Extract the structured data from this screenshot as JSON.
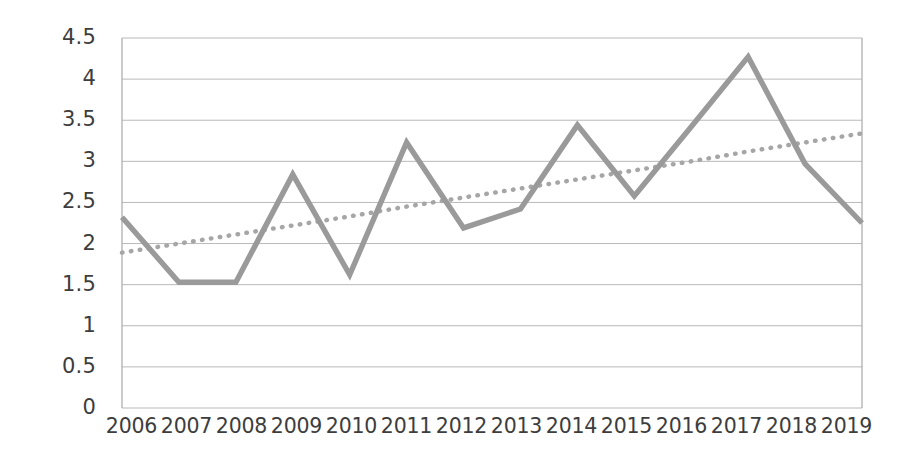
{
  "chart_data": {
    "type": "line",
    "title": "",
    "xlabel": "",
    "ylabel": "",
    "categories": [
      "2006",
      "2007",
      "2008",
      "2009",
      "2010",
      "2011",
      "2012",
      "2013",
      "2014",
      "2015",
      "2016",
      "2017",
      "2018",
      "2019"
    ],
    "series": [
      {
        "name": "series-1",
        "style": "solid",
        "color": "#9a9a9a",
        "values": [
          2.32,
          1.53,
          1.53,
          2.84,
          1.62,
          3.23,
          2.19,
          2.42,
          3.44,
          2.58,
          3.42,
          4.27,
          2.97,
          2.25
        ]
      },
      {
        "name": "trendline",
        "style": "dotted",
        "color": "#a6a6a6",
        "values": [
          1.89,
          2.0,
          2.11,
          2.22,
          2.33,
          2.45,
          2.56,
          2.67,
          2.78,
          2.89,
          3.0,
          3.12,
          3.23,
          3.34
        ]
      }
    ],
    "ylim": [
      0,
      4.5
    ],
    "y_ticks": [
      "0",
      "0.5",
      "1",
      "1.5",
      "2",
      "2.5",
      "3",
      "3.5",
      "4",
      "4.5"
    ],
    "y_tick_values": [
      0,
      0.5,
      1,
      1.5,
      2,
      2.5,
      3,
      3.5,
      4,
      4.5
    ],
    "grid": "horizontal",
    "legend": "none",
    "annotations": []
  },
  "colors": {
    "line": "#9a9a9a",
    "trendline": "#a6a6a6",
    "gridline": "#b9b9b9",
    "axis": "#a8a8a8",
    "text": "#3d3d3d",
    "background": "#ffffff"
  }
}
